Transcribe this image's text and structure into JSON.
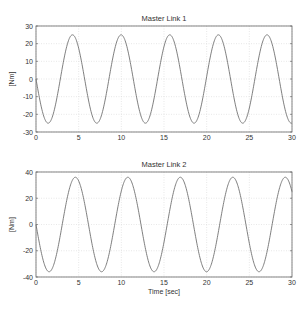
{
  "chart_data": [
    {
      "type": "line",
      "title": "Master Link 1",
      "xlabel": "",
      "ylabel": "[Nm]",
      "xlim": [
        0,
        30
      ],
      "ylim": [
        -30,
        30
      ],
      "xticks": [
        0,
        5,
        10,
        15,
        20,
        25,
        30
      ],
      "yticks": [
        -30,
        -20,
        -10,
        0,
        10,
        20,
        30
      ],
      "grid": true,
      "series": [
        {
          "name": "torque",
          "model": {
            "amplitude": 25,
            "period": 5.7,
            "form": "-A*sin(2*pi*t/period)"
          },
          "x": [
            0,
            1.4,
            4.3,
            7.1,
            10.0,
            12.8,
            15.7,
            18.5,
            21.4,
            24.2,
            27.1,
            30
          ],
          "y": [
            0,
            -25,
            25,
            -25,
            25,
            -25,
            25,
            -25,
            25,
            -25,
            25,
            -22
          ]
        }
      ]
    },
    {
      "type": "line",
      "title": "Master Link 2",
      "xlabel": "Time [sec]",
      "ylabel": "[Nm]",
      "xlim": [
        0,
        30
      ],
      "ylim": [
        -40,
        40
      ],
      "xticks": [
        0,
        5,
        10,
        15,
        20,
        25,
        30
      ],
      "yticks": [
        -40,
        -20,
        0,
        20,
        40
      ],
      "grid": true,
      "series": [
        {
          "name": "torque",
          "model": {
            "amplitude": 36,
            "period": 6.15,
            "form": "-A*sin(2*pi*t/period)"
          },
          "x": [
            0,
            1.5,
            4.6,
            7.7,
            10.8,
            13.8,
            16.9,
            20.0,
            23.1,
            26.1,
            29.2,
            30
          ],
          "y": [
            0,
            -36,
            36,
            -36,
            36,
            -36,
            36,
            -36,
            36,
            -36,
            36,
            33
          ]
        }
      ]
    }
  ],
  "panels": [
    {
      "title": "Master Link 1",
      "ylabel": "[Nm]",
      "xlabel": ""
    },
    {
      "title": "Master Link 2",
      "ylabel": "[Nm]",
      "xlabel": "Time [sec]"
    }
  ]
}
